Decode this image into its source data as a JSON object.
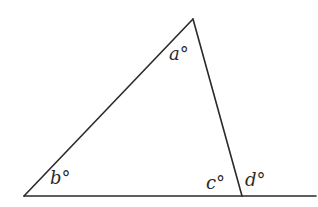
{
  "diagram": {
    "type": "triangle-exterior-angle",
    "vertices": {
      "apex": [
        193,
        19
      ],
      "bottom_left": [
        24,
        196
      ],
      "bottom_right": [
        242,
        196
      ]
    },
    "baseline_extension_end": [
      316,
      196
    ],
    "labels": {
      "a": "a°",
      "b": "b°",
      "c": "c°",
      "d": "d°"
    },
    "stroke_color": "#2a2a2a",
    "background": "#ffffff"
  }
}
